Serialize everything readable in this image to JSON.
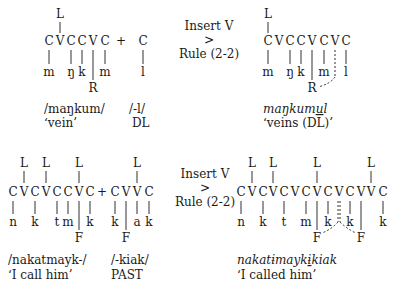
{
  "rule_label": {
    "line1": "Insert V",
    "line2": ">",
    "line3": "Rule (2-2)"
  },
  "examples": [
    {
      "input": {
        "stem_skeleton": [
          "C",
          "V",
          "C",
          "C",
          "V",
          "C"
        ],
        "stem_segments": [
          "m",
          "ŋ",
          "k",
          "m"
        ],
        "stem_tone": "L",
        "stem_root_node": "R",
        "plus": "+",
        "suffix_skeleton": [
          "C"
        ],
        "suffix_segments": [
          "l"
        ],
        "stem_form": "/maŋkum/",
        "stem_gloss": "‘vein’",
        "suffix_form": "/-l/",
        "suffix_gloss": "DL"
      },
      "output": {
        "skeleton": [
          "C",
          "V",
          "C",
          "C",
          "V",
          "C",
          "V",
          "C"
        ],
        "segments": [
          "m",
          "ŋ",
          "k",
          "m",
          "l"
        ],
        "tone": "L",
        "root_node": "R",
        "form_before_inserted": "maŋkum",
        "inserted_vowel": "u",
        "form_after_inserted": "l",
        "gloss": "‘veins (DL)’"
      }
    },
    {
      "input": {
        "stem_skeleton": [
          "C",
          "V",
          "C",
          "V",
          "C",
          "C",
          "V",
          "C"
        ],
        "stem_segments": [
          "n",
          "k",
          "t",
          "m",
          "k"
        ],
        "stem_tones": [
          "L",
          "L",
          "L"
        ],
        "stem_root_node": "F",
        "plus": "+",
        "suffix_skeleton": [
          "C",
          "V",
          "V",
          "C"
        ],
        "suffix_segments": [
          "k",
          "a",
          "k"
        ],
        "suffix_tones": [
          "L"
        ],
        "suffix_root_node": "F",
        "stem_form": "/nakatmayk-/",
        "stem_gloss": "‘I call him’",
        "suffix_form": "/-kiak/",
        "suffix_gloss": "PAST"
      },
      "output": {
        "skeleton": [
          "C",
          "V",
          "C",
          "V",
          "C",
          "V",
          "C",
          "V",
          "C",
          "V",
          "C",
          "V",
          "V",
          "C"
        ],
        "segments": [
          "n",
          "k",
          "t",
          "m",
          "k",
          "k",
          "k"
        ],
        "tones": [
          "L",
          "L",
          "L",
          "L"
        ],
        "root_nodes": [
          "F",
          "F"
        ],
        "form_before_inserted": "nakatɨmayk",
        "inserted_vowel": "ɨ",
        "form_after_inserted": "kiak",
        "gloss": "‘I called him’"
      }
    }
  ]
}
